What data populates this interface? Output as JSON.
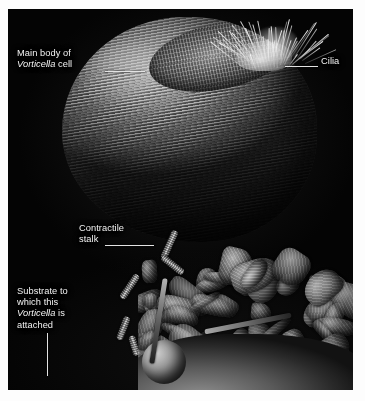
{
  "figure": {
    "type": "scanning-electron-micrograph",
    "subject": "Vorticella",
    "plate_background_color": "#040404",
    "page_background_color": "#ffffff",
    "label_text_color": "#f2f2f2",
    "leader_line_color": "#e3e3e3"
  },
  "labels": {
    "main_body": {
      "line1": "Main body of",
      "line2_italic": "Vorticella",
      "line2_rest": " cell",
      "full_text": "Main body of Vorticella cell"
    },
    "cilia": {
      "text": "Cilia"
    },
    "stalk": {
      "line1": "Contractile",
      "line2": "stalk",
      "full_text": "Contractile stalk"
    },
    "substrate": {
      "line1": "Substrate to",
      "line2": "which this",
      "line3_italic": "Vorticella",
      "line3_rest": " is",
      "line4": "attached",
      "full_text": "Substrate to which this Vorticella is attached"
    }
  },
  "structures": {
    "bell_body": "vorticella-bell-body",
    "peristome": "oral-peristome-ring",
    "cilia_tuft": "cilia-tuft",
    "contractile_stalk": "contractile-stalk",
    "substrate": "substrate-debris-surface",
    "sphere": "spherical-particle"
  }
}
